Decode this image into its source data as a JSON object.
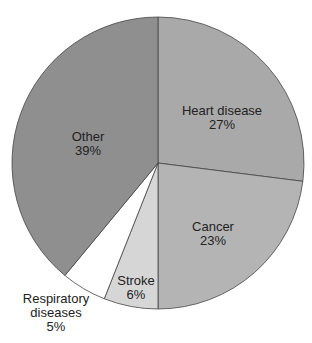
{
  "chart_data": {
    "type": "pie",
    "title": "",
    "slices": [
      {
        "label": "Heart disease",
        "value": 27,
        "pct": "27%",
        "color": "#a9a9a9"
      },
      {
        "label": "Cancer",
        "value": 23,
        "pct": "23%",
        "color": "#b4b4b4"
      },
      {
        "label": "Stroke",
        "value": 6,
        "pct": "6%",
        "color": "#d6d6d6"
      },
      {
        "label": "Respiratory diseases",
        "value": 5,
        "pct": "5%",
        "color": "#ffffff"
      },
      {
        "label": "Other",
        "value": 39,
        "pct": "39%",
        "color": "#8f8f8f"
      }
    ],
    "start_angle": "12 o'clock, clockwise"
  },
  "labels": {
    "heart": {
      "name": "Heart disease",
      "pct": "27%"
    },
    "cancer": {
      "name": "Cancer",
      "pct": "23%"
    },
    "stroke": {
      "name": "Stroke",
      "pct": "6%"
    },
    "resp": {
      "name1": "Respiratory",
      "name2": "diseases",
      "pct": "5%"
    },
    "other": {
      "name": "Other",
      "pct": "39%"
    }
  }
}
